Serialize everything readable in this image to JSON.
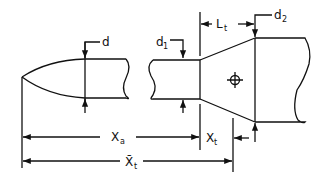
{
  "diagram": {
    "labels": {
      "d": {
        "main": "d",
        "sub": ""
      },
      "d1": {
        "main": "d",
        "sub": "1"
      },
      "d2": {
        "main": "d",
        "sub": "2"
      },
      "Lt": {
        "main": "L",
        "sub": "t"
      },
      "Xa": {
        "main": "X",
        "sub": "a"
      },
      "Xt": {
        "main": "X",
        "sub": "t"
      },
      "Xbar_t": {
        "main": "X̄",
        "sub": "t"
      }
    },
    "symbols": [
      "center-of-gravity-crosshair"
    ],
    "colors": {
      "line": "#111111",
      "background": "#ffffff"
    }
  }
}
